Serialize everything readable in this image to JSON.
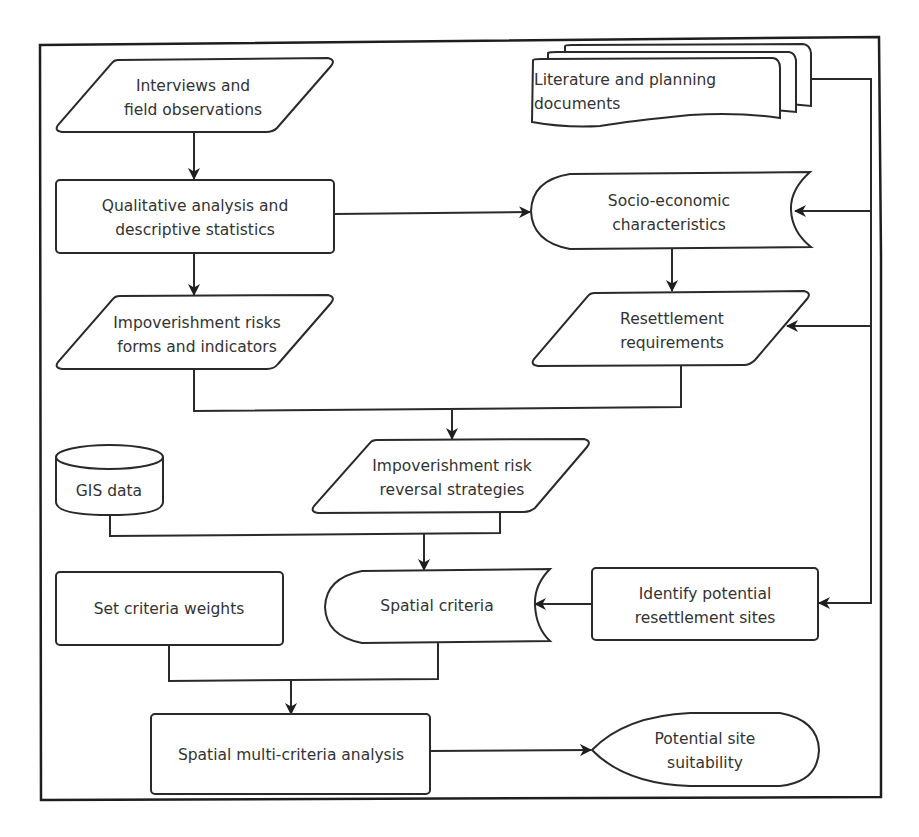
{
  "diagram": {
    "type": "flowchart",
    "colors": {
      "stroke": "#2a2a2a",
      "fill": "#ffffff",
      "text": "#333333"
    },
    "nodes": {
      "interviews": {
        "shape": "parallelogram",
        "lines": [
          "Interviews and",
          "field observations"
        ]
      },
      "qualitative": {
        "shape": "process",
        "lines": [
          "Qualitative analysis and",
          "descriptive statistics"
        ]
      },
      "risks_forms": {
        "shape": "parallelogram",
        "lines": [
          "Impoverishment risks",
          "forms and indicators"
        ]
      },
      "literature": {
        "shape": "multi-document",
        "lines": [
          "Literature and planning",
          "documents"
        ]
      },
      "socio_economic": {
        "shape": "stored-data",
        "lines": [
          "Socio-economic",
          "characteristics"
        ]
      },
      "resettlement_req": {
        "shape": "parallelogram",
        "lines": [
          "Resettlement",
          "requirements"
        ]
      },
      "reversal": {
        "shape": "parallelogram",
        "lines": [
          "Impoverishment risk",
          "reversal strategies"
        ]
      },
      "gis": {
        "shape": "database",
        "lines": [
          "GIS data"
        ]
      },
      "spatial_criteria": {
        "shape": "stored-data",
        "lines": [
          "Spatial criteria"
        ]
      },
      "weights": {
        "shape": "process",
        "lines": [
          "Set criteria weights"
        ]
      },
      "identify_sites": {
        "shape": "process",
        "lines": [
          "Identify potential",
          "resettlement  sites"
        ]
      },
      "smca": {
        "shape": "process",
        "lines": [
          "Spatial multi-criteria analysis"
        ]
      },
      "suitability": {
        "shape": "display",
        "lines": [
          "Potential site",
          "suitability"
        ]
      }
    },
    "edges": [
      {
        "from": "interviews",
        "to": "qualitative"
      },
      {
        "from": "qualitative",
        "to": "risks_forms"
      },
      {
        "from": "qualitative",
        "to": "socio_economic"
      },
      {
        "from": "literature",
        "to": "socio_economic"
      },
      {
        "from": "literature",
        "to": "resettlement_req"
      },
      {
        "from": "literature",
        "to": "identify_sites"
      },
      {
        "from": "socio_economic",
        "to": "resettlement_req"
      },
      {
        "from": "risks_forms",
        "to": "reversal"
      },
      {
        "from": "resettlement_req",
        "to": "reversal"
      },
      {
        "from": "gis",
        "to": "spatial_criteria"
      },
      {
        "from": "reversal",
        "to": "spatial_criteria"
      },
      {
        "from": "identify_sites",
        "to": "spatial_criteria"
      },
      {
        "from": "weights",
        "to": "smca"
      },
      {
        "from": "spatial_criteria",
        "to": "smca"
      },
      {
        "from": "smca",
        "to": "suitability"
      }
    ]
  }
}
